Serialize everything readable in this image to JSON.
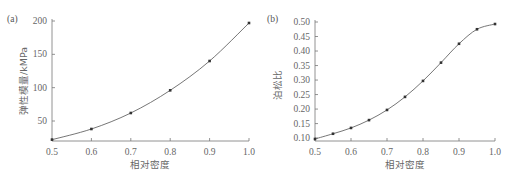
{
  "chart_data": [
    {
      "type": "line",
      "panel": "(a)",
      "title": "",
      "xlabel": "相对密度",
      "ylabel": "弹性模量/kMPa",
      "x": [
        0.5,
        0.6,
        0.7,
        0.8,
        0.9,
        1.0
      ],
      "series": [
        {
          "name": "弹性模量",
          "values": [
            22,
            38,
            62,
            96,
            140,
            197
          ]
        }
      ],
      "xlim": [
        0.5,
        1.0
      ],
      "ylim": [
        20,
        200
      ],
      "xticks": [
        "0.5",
        "0.6",
        "0.7",
        "0.8",
        "0.9",
        "1.0"
      ],
      "yticks": [
        "50",
        "100",
        "150",
        "200"
      ],
      "grid": false,
      "legend": "none"
    },
    {
      "type": "line",
      "panel": "(b)",
      "title": "",
      "xlabel": "相对密度",
      "ylabel": "泊松比",
      "x": [
        0.5,
        0.55,
        0.6,
        0.65,
        0.7,
        0.75,
        0.8,
        0.85,
        0.9,
        0.95,
        1.0
      ],
      "series": [
        {
          "name": "泊松比",
          "values": [
            0.097,
            0.115,
            0.135,
            0.162,
            0.197,
            0.242,
            0.297,
            0.36,
            0.425,
            0.475,
            0.493
          ]
        }
      ],
      "xlim": [
        0.5,
        1.0
      ],
      "ylim": [
        0.09,
        0.5
      ],
      "xticks": [
        "0.5",
        "0.6",
        "0.7",
        "0.8",
        "0.9",
        "1.0"
      ],
      "yticks": [
        "0.10",
        "0.15",
        "0.20",
        "0.25",
        "0.30",
        "0.35",
        "0.40",
        "0.45",
        "0.50"
      ],
      "grid": false,
      "legend": "none"
    }
  ],
  "charts": {
    "a": {
      "panel_label": "(a)",
      "xlabel": "相对密度",
      "ylabel": "弹性模量/kMPa",
      "xticks": [
        "0.5",
        "0.6",
        "0.7",
        "0.8",
        "0.9",
        "1.0"
      ],
      "yticks": [
        "50",
        "100",
        "150",
        "200"
      ]
    },
    "b": {
      "panel_label": "(b)",
      "xlabel": "相对密度",
      "ylabel": "泊松比",
      "xticks": [
        "0.5",
        "0.6",
        "0.7",
        "0.8",
        "0.9",
        "1.0"
      ],
      "yticks": [
        "0.10",
        "0.15",
        "0.20",
        "0.25",
        "0.30",
        "0.35",
        "0.40",
        "0.45",
        "0.50"
      ]
    }
  }
}
